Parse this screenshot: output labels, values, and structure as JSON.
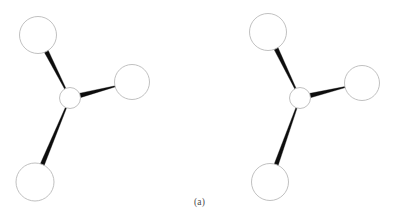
{
  "figure": {
    "caption": "(a)",
    "background_color": "#ffffff",
    "bond_color": "#0d0d0d",
    "atom_fill_color": "#ffffff",
    "atom_stroke_color": "#b9b9b9",
    "caption_color": "#4a4a4a",
    "atom_stroke_width": 0.9,
    "width": 399,
    "height": 221
  },
  "molecules": [
    {
      "name": "molecule-left",
      "label": "Left trigonal pyramidal molecule",
      "center_atom": {
        "name": "center-atom",
        "cx": 70,
        "cy": 98,
        "r": 10.5
      },
      "outer_atoms": [
        {
          "name": "top-left-atom",
          "cx": 38,
          "cy": 35,
          "r": 18.5
        },
        {
          "name": "right-atom",
          "cx": 132,
          "cy": 82,
          "r": 17.5
        },
        {
          "name": "bottom-left-atom",
          "cx": 35,
          "cy": 182,
          "r": 19.0
        }
      ],
      "bonds": [
        {
          "name": "bond-center-to-top-left",
          "from": "center-atom",
          "to": "top-left-atom",
          "wide_end": "to",
          "wide_width": 4.4,
          "narrow_width": 1.3
        },
        {
          "name": "bond-center-to-right",
          "from": "center-atom",
          "to": "right-atom",
          "wide_end": "from",
          "wide_width": 4.6,
          "narrow_width": 0.9
        },
        {
          "name": "bond-center-to-bottom-left",
          "from": "center-atom",
          "to": "bottom-left-atom",
          "wide_end": "to",
          "wide_width": 4.2,
          "narrow_width": 1.2
        }
      ]
    },
    {
      "name": "molecule-right",
      "label": "Right trigonal pyramidal molecule",
      "center_atom": {
        "name": "center-atom",
        "cx": 300,
        "cy": 98,
        "r": 10.5
      },
      "outer_atoms": [
        {
          "name": "top-atom",
          "cx": 268,
          "cy": 32,
          "r": 18.5
        },
        {
          "name": "right-atom",
          "cx": 362,
          "cy": 83,
          "r": 17.5
        },
        {
          "name": "bottom-atom",
          "cx": 270,
          "cy": 182,
          "r": 18.5
        }
      ],
      "bonds": [
        {
          "name": "bond-center-to-top",
          "from": "center-atom",
          "to": "top-atom",
          "wide_end": "to",
          "wide_width": 4.4,
          "narrow_width": 1.3
        },
        {
          "name": "bond-center-to-right",
          "from": "center-atom",
          "to": "right-atom",
          "wide_end": "from",
          "wide_width": 4.6,
          "narrow_width": 0.9
        },
        {
          "name": "bond-center-to-bottom",
          "from": "center-atom",
          "to": "bottom-atom",
          "wide_end": "to",
          "wide_width": 4.2,
          "narrow_width": 1.2
        }
      ]
    }
  ]
}
